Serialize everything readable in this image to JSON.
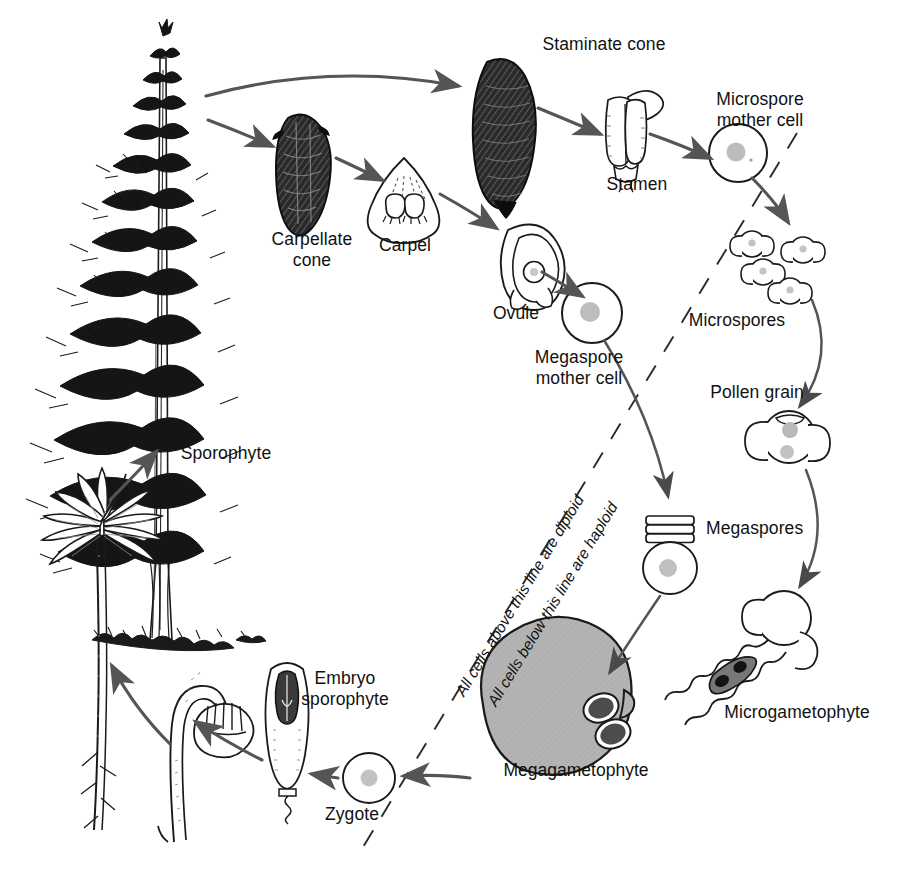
{
  "diagram": {
    "background_color": "#ffffff",
    "ink_color": "#111111",
    "arrow_color": "#555555",
    "shade_color": "#b0b0b0",
    "cell_nucleus_color": "#bdbdbd"
  },
  "labels": {
    "sporophyte": "Sporophyte",
    "staminate_cone": "Staminate cone",
    "carpellate_cone": "Carpellate\ncone",
    "carpel": "Carpel",
    "stamen": "Stamen",
    "microspore_mother_cell": "Microspore\nmother cell",
    "ovule": "Ovule",
    "megaspore_mother_cell": "Megaspore\nmother cell",
    "microspores": "Microspores",
    "pollen_grain": "Pollen grain",
    "megaspores": "Megaspores",
    "microgametophyte": "Microgametophyte",
    "megagametophyte": "Megagametophyte",
    "zygote": "Zygote",
    "embryo_sporophyte": "Embryo\nsporophyte",
    "diploid_note": "All cells above this line are diploid",
    "haploid_note": "All cells below this line are haploid"
  },
  "structures": [
    {
      "name": "mature-pine-tree",
      "label_key": "sporophyte",
      "ploidy": "diploid"
    },
    {
      "name": "staminate-cone",
      "label_key": "staminate_cone",
      "ploidy": "diploid"
    },
    {
      "name": "carpellate-cone",
      "label_key": "carpellate_cone",
      "ploidy": "diploid"
    },
    {
      "name": "carpel",
      "label_key": "carpel",
      "ploidy": "diploid"
    },
    {
      "name": "stamen",
      "label_key": "stamen",
      "ploidy": "diploid"
    },
    {
      "name": "microspore-mother-cell",
      "label_key": "microspore_mother_cell",
      "ploidy": "diploid"
    },
    {
      "name": "ovule",
      "label_key": "ovule",
      "ploidy": "diploid"
    },
    {
      "name": "megaspore-mother-cell",
      "label_key": "megaspore_mother_cell",
      "ploidy": "diploid"
    },
    {
      "name": "microspores",
      "label_key": "microspores",
      "ploidy": "haploid",
      "count": 4
    },
    {
      "name": "pollen-grain",
      "label_key": "pollen_grain",
      "ploidy": "haploid"
    },
    {
      "name": "megaspores",
      "label_key": "megaspores",
      "ploidy": "haploid",
      "count": 4
    },
    {
      "name": "microgametophyte",
      "label_key": "microgametophyte",
      "ploidy": "haploid"
    },
    {
      "name": "megagametophyte",
      "label_key": "megagametophyte",
      "ploidy": "haploid"
    },
    {
      "name": "zygote",
      "label_key": "zygote",
      "ploidy": "diploid"
    },
    {
      "name": "embryo-sporophyte",
      "label_key": "embryo_sporophyte",
      "ploidy": "diploid"
    },
    {
      "name": "germinating-seed",
      "label_key": null,
      "ploidy": "diploid"
    },
    {
      "name": "young-seedling",
      "label_key": null,
      "ploidy": "diploid"
    }
  ],
  "label_positions": {
    "staminate_cone": {
      "x": 604,
      "y": 34
    },
    "microspore_mother_cell": {
      "x": 760,
      "y": 89
    },
    "stamen": {
      "x": 637,
      "y": 174
    },
    "carpellate_cone": {
      "x": 312,
      "y": 229
    },
    "carpel": {
      "x": 405,
      "y": 235
    },
    "ovule": {
      "x": 516,
      "y": 303
    },
    "megaspore_mother_cell": {
      "x": 579,
      "y": 347
    },
    "microspores": {
      "x": 737,
      "y": 310
    },
    "pollen_grain": {
      "x": 757,
      "y": 382
    },
    "sporophyte": {
      "x": 226,
      "y": 443
    },
    "megaspores": {
      "x": 736,
      "y": 518
    },
    "microgametophyte": {
      "x": 797,
      "y": 702
    },
    "megagametophyte": {
      "x": 576,
      "y": 760
    },
    "embryo_sporophyte": {
      "x": 345,
      "y": 668
    },
    "zygote": {
      "x": 352,
      "y": 804
    }
  }
}
